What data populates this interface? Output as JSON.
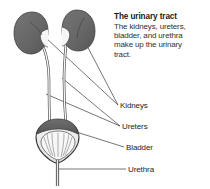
{
  "figure": {
    "type": "anatomical-diagram",
    "subject": "urinary tract",
    "background_color": "#ffffff",
    "width": 210,
    "height": 189
  },
  "caption": {
    "title": "The urinary tract",
    "body_lines": [
      "The kidneys, ureters,",
      "bladder, and urethra",
      "make up the urinary",
      "tract."
    ]
  },
  "labels": {
    "kidneys": "Kidneys",
    "ureters": "Ureters",
    "bladder": "Bladder",
    "urethra": "Urethra"
  },
  "colors": {
    "organ_fill": "#6b6b6b",
    "organ_fill_dark": "#5a5a5a",
    "organ_outline": "#3a3a3a",
    "tube_outline": "#4a4a4a",
    "tube_fill": "#f2f2f2",
    "leader_line": "#3a3a3a",
    "text": "#232323",
    "title_text": "#1a1a1a",
    "body_text": "#303030"
  },
  "parts": [
    {
      "name": "left-kidney",
      "label": "Kidneys"
    },
    {
      "name": "right-kidney",
      "label": "Kidneys"
    },
    {
      "name": "left-ureter",
      "label": "Ureters"
    },
    {
      "name": "right-ureter",
      "label": "Ureters"
    },
    {
      "name": "bladder",
      "label": "Bladder"
    },
    {
      "name": "urethra",
      "label": "Urethra"
    }
  ]
}
